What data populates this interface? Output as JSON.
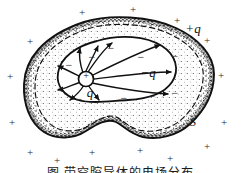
{
  "figure": {
    "kind": "physics-diagram",
    "caption_partial": "图  带空腔导体的电场分布",
    "colors": {
      "ink": "#111111",
      "stipple": "#2b2b2b",
      "paper": "#ffffff"
    },
    "labels": [
      {
        "name": "central-charge-symbol",
        "text": "+",
        "x": 86,
        "y": 76,
        "size": 10,
        "italic": false
      },
      {
        "name": "inner-charge-label",
        "text": "q",
        "x": 90,
        "y": 92,
        "size": 13,
        "italic": true
      },
      {
        "name": "induced-charge-label",
        "text": "−q",
        "x": 148,
        "y": 72,
        "size": 13,
        "italic": true
      },
      {
        "name": "outer-charge-label",
        "text": "+q",
        "x": 193,
        "y": 28,
        "size": 13,
        "italic": true
      },
      {
        "name": "gaussian-surface-label",
        "text": "S",
        "x": 193,
        "y": 122,
        "size": 12,
        "italic": true
      }
    ],
    "minus_signs": [
      {
        "x": 111,
        "y": 48
      },
      {
        "x": 141,
        "y": 57
      },
      {
        "x": 152,
        "y": 96
      },
      {
        "x": 124,
        "y": 98
      },
      {
        "x": 79,
        "y": 99
      },
      {
        "x": 62,
        "y": 88
      },
      {
        "x": 69,
        "y": 65
      },
      {
        "x": 92,
        "y": 57
      },
      {
        "x": 175,
        "y": 56
      },
      {
        "x": 175,
        "y": 93
      }
    ],
    "outer_plus_signs": [
      {
        "x": 82,
        "y": 12
      },
      {
        "x": 133,
        "y": 9
      },
      {
        "x": 177,
        "y": 20
      },
      {
        "x": 207,
        "y": 40
      },
      {
        "x": 30,
        "y": 41
      },
      {
        "x": 10,
        "y": 76
      },
      {
        "x": 12,
        "y": 122
      },
      {
        "x": 221,
        "y": 75
      },
      {
        "x": 224,
        "y": 122
      },
      {
        "x": 30,
        "y": 152
      },
      {
        "x": 57,
        "y": 160
      },
      {
        "x": 92,
        "y": 152
      },
      {
        "x": 140,
        "y": 150
      },
      {
        "x": 170,
        "y": 158
      },
      {
        "x": 207,
        "y": 146
      }
    ]
  }
}
